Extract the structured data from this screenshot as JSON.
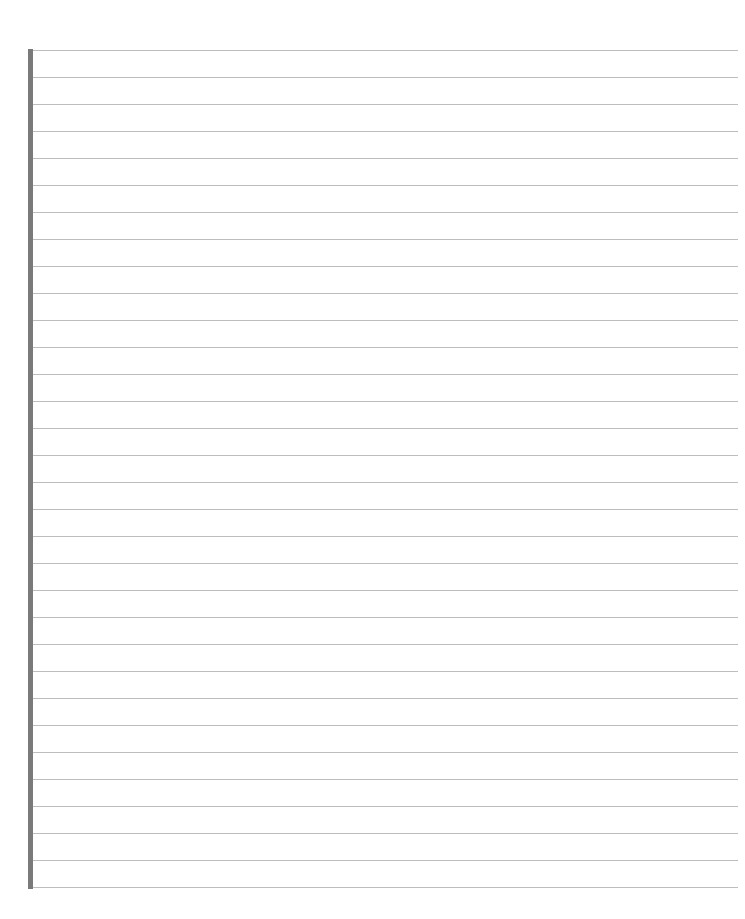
{
  "page": {
    "type": "lined-notebook-page",
    "line_count": 32,
    "first_line_y": 50,
    "line_spacing": 27,
    "colors": {
      "background": "#ffffff",
      "rule_line": "#bdbdbd",
      "margin_bar": "#7a7a7a"
    },
    "page_number": ""
  }
}
